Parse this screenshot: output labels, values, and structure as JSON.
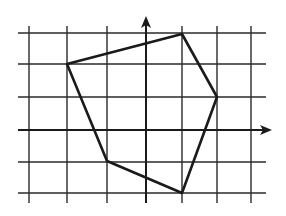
{
  "diagram": {
    "type": "coordinate-grid-polygon",
    "colors": {
      "background": "#ffffff",
      "grid": "#2a2a2a",
      "axis": "#1a1a1a",
      "polygon": "#1a1a1a"
    },
    "grid": {
      "vertical_x": [
        29,
        67,
        107,
        182,
        217,
        251
      ],
      "horizontal_y": [
        33,
        64,
        97,
        162,
        193
      ],
      "x_span": [
        18,
        272
      ],
      "y_span": [
        26,
        203
      ]
    },
    "axes": {
      "x_axis": {
        "y": 130,
        "x_start": 18,
        "x_end": 272
      },
      "y_axis": {
        "x": 146,
        "y_start": 203,
        "y_end": 16
      }
    },
    "polygon": {
      "shape": "pentagon",
      "vertices": [
        [
          67,
          64
        ],
        [
          182,
          34
        ],
        [
          217,
          97
        ],
        [
          182,
          193
        ],
        [
          107,
          161
        ]
      ]
    }
  }
}
